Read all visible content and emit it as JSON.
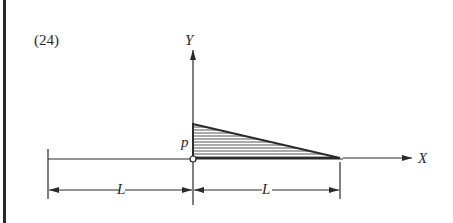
{
  "figure": {
    "number": "(24)",
    "y_axis_label": "Y",
    "x_axis_label": "X",
    "load_label": "p",
    "dim_left_label": "L",
    "dim_right_label": "L"
  },
  "colors": {
    "ink": "#2a2a2a",
    "background": "#ffffff"
  }
}
